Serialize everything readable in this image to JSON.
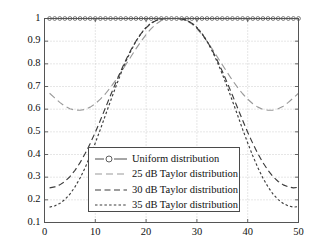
{
  "chart_data": {
    "type": "line",
    "title": "",
    "xlabel": "",
    "ylabel": "",
    "xlim": [
      0,
      50
    ],
    "ylim": [
      0.1,
      1.0
    ],
    "xticks": [
      0,
      10,
      20,
      30,
      40,
      50
    ],
    "yticks": [
      0.1,
      0.2,
      0.3,
      0.4,
      0.5,
      0.6,
      0.7,
      0.8,
      0.9,
      1
    ],
    "grid": true,
    "legend_position": "center",
    "x": [
      1,
      2,
      3,
      4,
      5,
      6,
      7,
      8,
      9,
      10,
      11,
      12,
      13,
      14,
      15,
      16,
      17,
      18,
      19,
      20,
      21,
      22,
      23,
      24,
      25,
      26,
      27,
      28,
      29,
      30,
      31,
      32,
      33,
      34,
      35,
      36,
      37,
      38,
      39,
      40,
      41,
      42,
      43,
      44,
      45,
      46,
      47,
      48,
      49,
      50
    ],
    "series": [
      {
        "name": "Uniform distribution",
        "color": "#4d4d4d",
        "style": "solid",
        "marker": "circle",
        "values": [
          1,
          1,
          1,
          1,
          1,
          1,
          1,
          1,
          1,
          1,
          1,
          1,
          1,
          1,
          1,
          1,
          1,
          1,
          1,
          1,
          1,
          1,
          1,
          1,
          1,
          1,
          1,
          1,
          1,
          1,
          1,
          1,
          1,
          1,
          1,
          1,
          1,
          1,
          1,
          1,
          1,
          1,
          1,
          1,
          1,
          1,
          1,
          1,
          1,
          1
        ]
      },
      {
        "name": "25 dB Taylor distribution",
        "color": "#9a9a9a",
        "style": "longdash",
        "marker": "none",
        "values": [
          0.67,
          0.65,
          0.63,
          0.613,
          0.602,
          0.596,
          0.595,
          0.599,
          0.609,
          0.624,
          0.644,
          0.668,
          0.696,
          0.727,
          0.761,
          0.796,
          0.831,
          0.866,
          0.899,
          0.929,
          0.955,
          0.976,
          0.991,
          0.999,
          1.0,
          1.0,
          0.999,
          0.991,
          0.976,
          0.955,
          0.929,
          0.899,
          0.866,
          0.831,
          0.796,
          0.761,
          0.727,
          0.696,
          0.668,
          0.644,
          0.624,
          0.609,
          0.599,
          0.595,
          0.596,
          0.602,
          0.613,
          0.63,
          0.65,
          0.67
        ]
      },
      {
        "name": "30 dB Taylor distribution",
        "color": "#3c3c3c",
        "style": "dash",
        "marker": "none",
        "values": [
          0.253,
          0.257,
          0.266,
          0.281,
          0.302,
          0.33,
          0.364,
          0.404,
          0.449,
          0.498,
          0.551,
          0.606,
          0.661,
          0.715,
          0.767,
          0.816,
          0.861,
          0.9,
          0.933,
          0.959,
          0.979,
          0.991,
          0.998,
          1.0,
          1.0,
          1.0,
          0.998,
          0.991,
          0.979,
          0.959,
          0.933,
          0.9,
          0.861,
          0.816,
          0.767,
          0.715,
          0.661,
          0.606,
          0.551,
          0.498,
          0.449,
          0.404,
          0.364,
          0.33,
          0.302,
          0.281,
          0.266,
          0.257,
          0.253,
          0.255
        ]
      },
      {
        "name": "35 dB Taylor distribution",
        "color": "#3c3c3c",
        "style": "dot",
        "marker": "none",
        "values": [
          0.168,
          0.173,
          0.184,
          0.201,
          0.225,
          0.257,
          0.296,
          0.342,
          0.394,
          0.451,
          0.511,
          0.574,
          0.636,
          0.697,
          0.755,
          0.809,
          0.857,
          0.899,
          0.934,
          0.961,
          0.98,
          0.992,
          0.998,
          1.0,
          1.0,
          1.0,
          0.998,
          0.992,
          0.98,
          0.961,
          0.934,
          0.899,
          0.857,
          0.809,
          0.755,
          0.697,
          0.636,
          0.574,
          0.511,
          0.451,
          0.394,
          0.342,
          0.296,
          0.257,
          0.225,
          0.201,
          0.184,
          0.173,
          0.168,
          0.17
        ]
      }
    ]
  },
  "axes": {
    "frame_color": "#555555",
    "grid_color": "#b8b8b8",
    "tick_color": "#555555"
  },
  "legend": {
    "entries": [
      {
        "label": "Uniform distribution"
      },
      {
        "label": "25 dB Taylor distribution"
      },
      {
        "label": "30 dB Taylor distribution"
      },
      {
        "label": "35 dB Taylor distribution"
      }
    ]
  }
}
